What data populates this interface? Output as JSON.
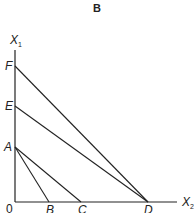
{
  "title": "B",
  "axes": {
    "y_label": "X",
    "y_sub": "1",
    "x_label": "X",
    "x_sub": "2",
    "origin": "0"
  },
  "points": {
    "F": "F",
    "E": "E",
    "A": "A",
    "B": "B",
    "C": "C",
    "D": "D"
  },
  "lines": [
    {
      "from": "A",
      "to": "B"
    },
    {
      "from": "A",
      "to": "C"
    },
    {
      "from": "E",
      "to": "D"
    },
    {
      "from": "F",
      "to": "D"
    }
  ],
  "colors": {
    "ink": "#222222",
    "background": "#ffffff"
  }
}
